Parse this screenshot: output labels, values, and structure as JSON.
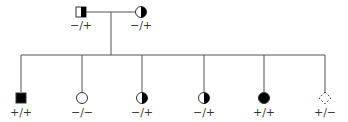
{
  "diagram": {
    "type": "pedigree",
    "parents": [
      {
        "id": "father",
        "sex": "male",
        "shading": "right-half",
        "genotype": "−/+"
      },
      {
        "id": "mother",
        "sex": "female",
        "shading": "right-half",
        "genotype": "−/+"
      }
    ],
    "children": [
      {
        "id": "child-1",
        "sex": "male",
        "shading": "full",
        "genotype": "+/+"
      },
      {
        "id": "child-2",
        "sex": "female",
        "shading": "none",
        "genotype": "−/−"
      },
      {
        "id": "child-3",
        "sex": "female",
        "shading": "right-half",
        "genotype": "−/+"
      },
      {
        "id": "child-4",
        "sex": "female",
        "shading": "right-half",
        "genotype": "−/+"
      },
      {
        "id": "child-5",
        "sex": "female",
        "shading": "full",
        "genotype": "+/+"
      },
      {
        "id": "child-6",
        "sex": "unknown",
        "shading": "none",
        "style": "dashed",
        "genotype": "+/−"
      }
    ],
    "colors": {
      "line": "#555555",
      "fill": "#000000",
      "text": "#333333"
    }
  }
}
